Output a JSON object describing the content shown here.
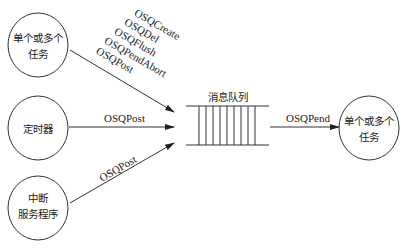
{
  "nodes": {
    "tasks_left": {
      "line1": "单个或多个",
      "line2": "任务"
    },
    "timer": {
      "label": "定时器"
    },
    "isr": {
      "line1": "中断",
      "line2": "服务程序"
    },
    "queue": {
      "label": "消息队列"
    },
    "tasks_right": {
      "line1": "单个或多个",
      "line2": "任务"
    }
  },
  "edges": {
    "tasks_to_queue": [
      "OSQCreate",
      "OSQDel",
      "OSQFlush",
      "OSQPendAbort",
      "OSQPost"
    ],
    "timer_to_queue": "OSQPost",
    "isr_to_queue": "OSQPost",
    "queue_to_tasks": "OSQPend"
  }
}
